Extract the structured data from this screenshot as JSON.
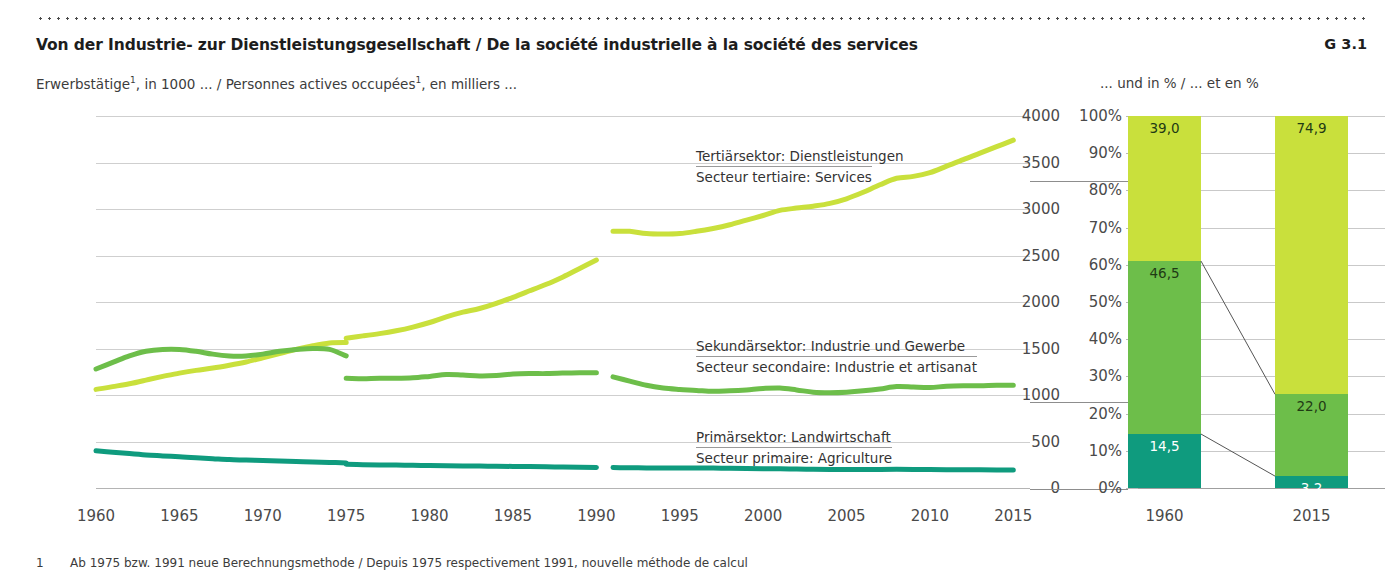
{
  "header": {
    "title": "Von der Industrie- zur Dienstleistungsgesellschaft / De la société industrielle à la société des services",
    "chart_number": "G 3.1",
    "subtitle_left_pre": "Erwerbstätige",
    "subtitle_left_sup": "1",
    "subtitle_left_mid": ", in 1000 ... / Personnes actives occupées",
    "subtitle_left_sup2": "1",
    "subtitle_left_post": ", en milliers ...",
    "subtitle_right": "... und in % / ... et en %"
  },
  "footnote": {
    "marker": "1",
    "text": "Ab 1975 bzw. 1991 neue Berechnungsmethode / Depuis 1975 respectivement 1991, nouvelle méthode de calcul"
  },
  "legend": [
    {
      "de": "Tertiärsektor: Dienstleistungen",
      "fr": "Secteur tertiaire: Services",
      "color": "#c9e03c"
    },
    {
      "de": "Sekundärsektor: Industrie und Gewerbe",
      "fr": "Secteur secondaire: Industrie et artisanat",
      "color": "#6dbe4a"
    },
    {
      "de": "Primärsektor: Landwirtschaft",
      "fr": "Secteur primaire: Agriculture",
      "color": "#0f9b7e"
    }
  ],
  "colors": {
    "tertiary": "#c9e03c",
    "secondary": "#6dbe4a",
    "primary": "#0f9b7e",
    "grid": "#cfcfcf",
    "text": "#3c3c3c"
  },
  "chart_data": [
    {
      "type": "line",
      "title": "Erwerbstätige, in 1000",
      "xlabel": "",
      "ylabel": "",
      "xlim": [
        1960,
        2016
      ],
      "ylim": [
        0,
        4000
      ],
      "yticks": [
        0,
        500,
        1000,
        1500,
        2000,
        2500,
        3000,
        3500,
        4000
      ],
      "xticks": [
        1960,
        1965,
        1970,
        1975,
        1980,
        1985,
        1990,
        1995,
        2000,
        2005,
        2010,
        2015
      ],
      "grid": true,
      "legend_position": "inline-annotations",
      "break_note": "series split at 1975 and at 1990/1991 (new calculation method)",
      "series": [
        {
          "name": "Tertiärsektor: Dienstleistungen / Secteur tertiaire: Services",
          "color": "#c9e03c",
          "segments": [
            {
              "x": [
                1960,
                1961,
                1962,
                1963,
                1964,
                1965,
                1966,
                1967,
                1968,
                1969,
                1970,
                1971,
                1972,
                1973,
                1974,
                1975
              ],
              "y": [
                1060,
                1090,
                1120,
                1160,
                1200,
                1235,
                1265,
                1290,
                1320,
                1355,
                1400,
                1445,
                1490,
                1530,
                1560,
                1565
              ]
            },
            {
              "x": [
                1975,
                1976,
                1977,
                1978,
                1979,
                1980,
                1981,
                1982,
                1983,
                1984,
                1985,
                1986,
                1987,
                1988,
                1989,
                1990
              ],
              "y": [
                1610,
                1635,
                1660,
                1690,
                1730,
                1780,
                1840,
                1890,
                1930,
                1985,
                2050,
                2120,
                2190,
                2270,
                2360,
                2450
              ]
            },
            {
              "x": [
                1991,
                1992,
                1993,
                1994,
                1995,
                1996,
                1997,
                1998,
                1999,
                2000,
                2001,
                2002,
                2003,
                2004,
                2005,
                2006,
                2007,
                2008,
                2009,
                2010,
                2011,
                2012,
                2013,
                2014,
                2015
              ],
              "y": [
                2760,
                2760,
                2735,
                2730,
                2735,
                2760,
                2790,
                2830,
                2880,
                2930,
                2985,
                3010,
                3030,
                3060,
                3110,
                3180,
                3260,
                3330,
                3350,
                3390,
                3460,
                3530,
                3600,
                3670,
                3740
              ]
            }
          ]
        },
        {
          "name": "Sekundärsektor: Industrie und Gewerbe / Secteur secondaire: Industrie et artisanat",
          "color": "#6dbe4a",
          "segments": [
            {
              "x": [
                1960,
                1961,
                1962,
                1963,
                1964,
                1965,
                1966,
                1967,
                1968,
                1969,
                1970,
                1971,
                1972,
                1973,
                1974,
                1975
              ],
              "y": [
                1280,
                1350,
                1420,
                1470,
                1490,
                1490,
                1470,
                1440,
                1420,
                1420,
                1440,
                1470,
                1490,
                1500,
                1490,
                1420
              ]
            },
            {
              "x": [
                1975,
                1976,
                1977,
                1978,
                1979,
                1980,
                1981,
                1982,
                1983,
                1984,
                1985,
                1986,
                1987,
                1988,
                1989,
                1990
              ],
              "y": [
                1180,
                1175,
                1180,
                1180,
                1185,
                1200,
                1220,
                1215,
                1205,
                1210,
                1225,
                1230,
                1230,
                1235,
                1240,
                1240
              ]
            },
            {
              "x": [
                1991,
                1992,
                1993,
                1994,
                1995,
                1996,
                1997,
                1998,
                1999,
                2000,
                2001,
                2002,
                2003,
                2004,
                2005,
                2006,
                2007,
                2008,
                2009,
                2010,
                2011,
                2012,
                2013,
                2014,
                2015
              ],
              "y": [
                1195,
                1150,
                1105,
                1075,
                1060,
                1050,
                1040,
                1045,
                1055,
                1070,
                1075,
                1055,
                1030,
                1025,
                1030,
                1045,
                1065,
                1090,
                1085,
                1080,
                1095,
                1100,
                1100,
                1105,
                1105
              ]
            }
          ]
        },
        {
          "name": "Primärsektor: Landwirtschaft / Secteur primaire: Agriculture",
          "color": "#0f9b7e",
          "segments": [
            {
              "x": [
                1960,
                1961,
                1962,
                1963,
                1964,
                1965,
                1966,
                1967,
                1968,
                1969,
                1970,
                1971,
                1972,
                1973,
                1974,
                1975
              ],
              "y": [
                400,
                385,
                370,
                355,
                345,
                335,
                325,
                315,
                305,
                300,
                295,
                290,
                285,
                280,
                275,
                270
              ]
            },
            {
              "x": [
                1975,
                1976,
                1977,
                1978,
                1979,
                1980,
                1981,
                1982,
                1983,
                1984,
                1985,
                1986,
                1987,
                1988,
                1989,
                1990
              ],
              "y": [
                255,
                250,
                248,
                246,
                244,
                242,
                240,
                238,
                236,
                234,
                232,
                230,
                228,
                226,
                224,
                222
              ]
            },
            {
              "x": [
                1991,
                1992,
                1993,
                1994,
                1995,
                1996,
                1997,
                1998,
                1999,
                2000,
                2001,
                2002,
                2003,
                2004,
                2005,
                2006,
                2007,
                2008,
                2009,
                2010,
                2011,
                2012,
                2013,
                2014,
                2015
              ],
              "y": [
                220,
                218,
                216,
                214,
                215,
                216,
                214,
                212,
                210,
                208,
                206,
                204,
                202,
                200,
                198,
                198,
                200,
                202,
                200,
                198,
                196,
                196,
                196,
                194,
                194
              ]
            }
          ]
        }
      ]
    },
    {
      "type": "bar",
      "subtype": "stacked-100",
      "title": "... und in % / ... et en %",
      "categories": [
        "1960",
        "2015"
      ],
      "ylim": [
        0,
        100
      ],
      "yticks": [
        "0%",
        "10%",
        "20%",
        "30%",
        "40%",
        "50%",
        "60%",
        "70%",
        "80%",
        "90%",
        "100%"
      ],
      "grid": true,
      "series": [
        {
          "name": "Primärsektor: Landwirtschaft / Secteur primaire: Agriculture",
          "color": "#0f9b7e",
          "values": [
            14.5,
            3.2
          ],
          "labels": [
            "14,5",
            "3,2"
          ]
        },
        {
          "name": "Sekundärsektor: Industrie und Gewerbe / Secteur secondaire: Industrie et artisanat",
          "color": "#6dbe4a",
          "values": [
            46.5,
            22.0
          ],
          "labels": [
            "46,5",
            "22,0"
          ]
        },
        {
          "name": "Tertiärsektor: Dienstleistungen / Secteur tertiaire: Services",
          "color": "#c9e03c",
          "values": [
            39.0,
            74.9
          ],
          "labels": [
            "39,0",
            "74,9"
          ]
        }
      ]
    }
  ]
}
